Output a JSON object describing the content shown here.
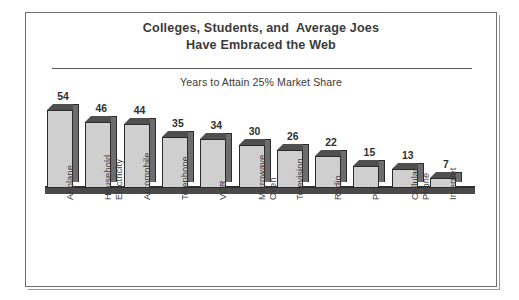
{
  "figure": {
    "title_line1": "Colleges, Students, and  Average Joes",
    "title_line2": "Have Embraced the Web",
    "subtitle": "Years to Attain 25% Market Share"
  },
  "colors": {
    "frame": "#6e6e6e",
    "bar_front": "#cfcfcf",
    "bar_side": "#6d6d6d",
    "bar_top": "#4f4f4f",
    "bar_outline": "#2b2b2b",
    "text": "#3b3b3b",
    "baseline": "#4a4a4a"
  },
  "chart_data": {
    "type": "bar",
    "title": "Colleges, Students, and  Average Joes Have Embraced the Web",
    "subtitle": "Years to Attain 25% Market Share",
    "xlabel": "",
    "ylabel": "",
    "ylim": [
      0,
      54
    ],
    "grid": false,
    "legend": false,
    "orientation": "vertical",
    "value_labels": true,
    "categories": [
      "Airplane",
      "Household\nElectricity",
      "Automobile",
      "Telephone",
      "VCR",
      "Microwave\nOven",
      "Television",
      "Radio",
      "PC",
      "Cellular\nPhone",
      "Internet"
    ],
    "values": [
      54,
      46,
      44,
      35,
      34,
      30,
      26,
      22,
      15,
      13,
      7
    ],
    "value_label_texts": [
      "54",
      "46",
      "44",
      "35",
      "34",
      "30",
      "26",
      "22",
      "15",
      "13",
      "7"
    ]
  }
}
